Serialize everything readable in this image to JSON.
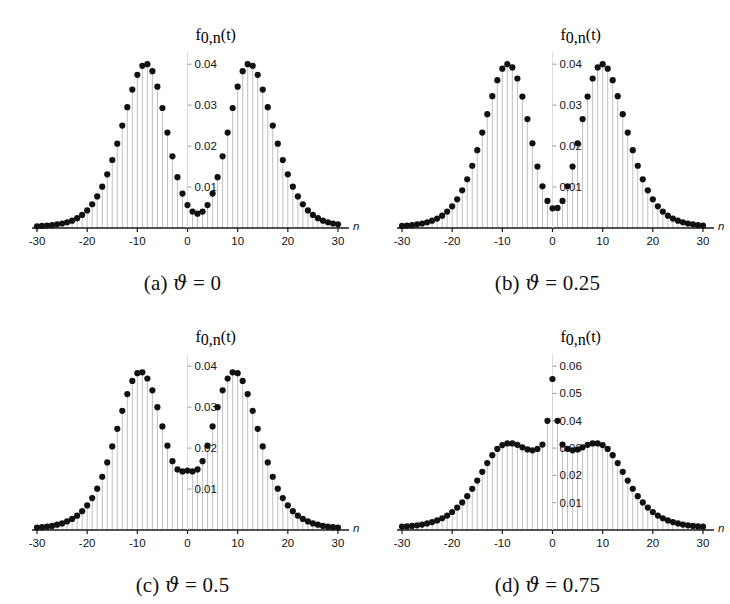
{
  "figure": {
    "background_color": "#ffffff",
    "marker_color": "#111111",
    "stem_color": "#b9b9b9",
    "axis_color": "#1a1a1a"
  },
  "panels": [
    {
      "key": "a",
      "caption_index": "(a)",
      "caption_symbol": "ϑ",
      "caption_equals": "=",
      "caption_value": "0",
      "caption_full": "(a) ϑ = 0"
    },
    {
      "key": "b",
      "caption_index": "(b)",
      "caption_symbol": "ϑ",
      "caption_equals": "=",
      "caption_value": "0.25",
      "caption_full": "(b) ϑ = 0.25"
    },
    {
      "key": "c",
      "caption_index": "(c)",
      "caption_symbol": "ϑ",
      "caption_equals": "=",
      "caption_value": "0.5",
      "caption_full": "(c) ϑ = 0.5"
    },
    {
      "key": "d",
      "caption_index": "(d)",
      "caption_symbol": "ϑ",
      "caption_equals": "=",
      "caption_value": "0.75",
      "caption_full": "(d) ϑ = 0.75"
    }
  ],
  "chart_data": [
    {
      "type": "scatter",
      "panel": "a",
      "title": "(a) ϑ = 0",
      "xlabel": "n",
      "ylabel": "f_{0,n}(t)",
      "ylabel_parts": {
        "base": "f",
        "sub": "0,",
        "sub_italic": "n",
        "tail": "(t)"
      },
      "xlim": [
        -31,
        31
      ],
      "ylim": [
        0,
        0.042
      ],
      "xticks": [
        -30,
        -20,
        -10,
        0,
        10,
        20,
        30
      ],
      "xticklabels": [
        "-30",
        "-20",
        "-10",
        "0",
        "10",
        "20",
        "30"
      ],
      "yticks": [
        0.01,
        0.02,
        0.03,
        0.04
      ],
      "yticklabels": [
        "0.01",
        "0.02",
        "0.03",
        "0.04"
      ],
      "grid": false,
      "stems": true,
      "x": [
        -30,
        -29,
        -28,
        -27,
        -26,
        -25,
        -24,
        -23,
        -22,
        -21,
        -20,
        -19,
        -18,
        -17,
        -16,
        -15,
        -14,
        -13,
        -12,
        -11,
        -10,
        -9,
        -8,
        -7,
        -6,
        -5,
        -4,
        -3,
        -2,
        -1,
        0,
        1,
        2,
        3,
        4,
        5,
        6,
        7,
        8,
        9,
        10,
        11,
        12,
        13,
        14,
        15,
        16,
        17,
        18,
        19,
        20,
        21,
        22,
        23,
        24,
        25,
        26,
        27,
        28,
        29,
        30
      ],
      "values": [
        0.0004,
        0.0005,
        0.0006,
        0.0007,
        0.0009,
        0.0011,
        0.0014,
        0.0018,
        0.0024,
        0.0032,
        0.0043,
        0.0058,
        0.0077,
        0.0101,
        0.0131,
        0.0166,
        0.0206,
        0.025,
        0.0295,
        0.0338,
        0.0374,
        0.0396,
        0.04,
        0.0383,
        0.0345,
        0.0293,
        0.0233,
        0.0175,
        0.0124,
        0.0084,
        0.0056,
        0.004,
        0.0035,
        0.004,
        0.0056,
        0.0084,
        0.0124,
        0.0175,
        0.0233,
        0.0293,
        0.0345,
        0.0383,
        0.04,
        0.0396,
        0.0374,
        0.0338,
        0.0295,
        0.025,
        0.0206,
        0.0166,
        0.0131,
        0.0101,
        0.0077,
        0.0058,
        0.0043,
        0.0032,
        0.0024,
        0.0018,
        0.0014,
        0.0011,
        0.0009
      ]
    },
    {
      "type": "scatter",
      "panel": "b",
      "title": "(b) ϑ = 0.25",
      "xlabel": "n",
      "ylabel": "f_{0,n}(t)",
      "ylabel_parts": {
        "base": "f",
        "sub": "0,",
        "sub_italic": "n",
        "tail": "(t)"
      },
      "xlim": [
        -31,
        31
      ],
      "ylim": [
        0,
        0.042
      ],
      "xticks": [
        -30,
        -20,
        -10,
        0,
        10,
        20,
        30
      ],
      "xticklabels": [
        "-30",
        "-20",
        "-10",
        "0",
        "10",
        "20",
        "30"
      ],
      "yticks": [
        0.01,
        0.02,
        0.03,
        0.04
      ],
      "yticklabels": [
        "0.01",
        "0.02",
        "0.03",
        "0.04"
      ],
      "grid": false,
      "stems": true,
      "x": [
        -30,
        -29,
        -28,
        -27,
        -26,
        -25,
        -24,
        -23,
        -22,
        -21,
        -20,
        -19,
        -18,
        -17,
        -16,
        -15,
        -14,
        -13,
        -12,
        -11,
        -10,
        -9,
        -8,
        -7,
        -6,
        -5,
        -4,
        -3,
        -2,
        -1,
        0,
        1,
        2,
        3,
        4,
        5,
        6,
        7,
        8,
        9,
        10,
        11,
        12,
        13,
        14,
        15,
        16,
        17,
        18,
        19,
        20,
        21,
        22,
        23,
        24,
        25,
        26,
        27,
        28,
        29,
        30
      ],
      "values": [
        0.0005,
        0.0006,
        0.0007,
        0.0009,
        0.0011,
        0.0014,
        0.0018,
        0.0023,
        0.003,
        0.004,
        0.0053,
        0.007,
        0.0092,
        0.0119,
        0.0152,
        0.019,
        0.0233,
        0.0278,
        0.0322,
        0.0361,
        0.0389,
        0.04,
        0.0392,
        0.0365,
        0.0321,
        0.0266,
        0.0207,
        0.015,
        0.0102,
        0.0066,
        0.0048,
        0.0049,
        0.0066,
        0.0102,
        0.015,
        0.0207,
        0.0266,
        0.0321,
        0.0365,
        0.0392,
        0.04,
        0.0389,
        0.0361,
        0.0322,
        0.0278,
        0.0233,
        0.019,
        0.0152,
        0.0119,
        0.0092,
        0.007,
        0.0053,
        0.004,
        0.003,
        0.0023,
        0.0018,
        0.0014,
        0.0011,
        0.0009,
        0.0007,
        0.0006
      ]
    },
    {
      "type": "scatter",
      "panel": "c",
      "title": "(c) ϑ = 0.5",
      "xlabel": "n",
      "ylabel": "f_{0,n}(t)",
      "ylabel_parts": {
        "base": "f",
        "sub": "0,",
        "sub_italic": "n",
        "tail": "(t)"
      },
      "xlim": [
        -31,
        31
      ],
      "ylim": [
        0,
        0.042
      ],
      "xticks": [
        -30,
        -20,
        -10,
        0,
        10,
        20,
        30
      ],
      "xticklabels": [
        "-30",
        "-20",
        "-10",
        "0",
        "10",
        "20",
        "30"
      ],
      "yticks": [
        0.01,
        0.02,
        0.03,
        0.04
      ],
      "yticklabels": [
        "0.01",
        "0.02",
        "0.03",
        "0.04"
      ],
      "grid": false,
      "stems": true,
      "x": [
        -30,
        -29,
        -28,
        -27,
        -26,
        -25,
        -24,
        -23,
        -22,
        -21,
        -20,
        -19,
        -18,
        -17,
        -16,
        -15,
        -14,
        -13,
        -12,
        -11,
        -10,
        -9,
        -8,
        -7,
        -6,
        -5,
        -4,
        -3,
        -2,
        -1,
        0,
        1,
        2,
        3,
        4,
        5,
        6,
        7,
        8,
        9,
        10,
        11,
        12,
        13,
        14,
        15,
        16,
        17,
        18,
        19,
        20,
        21,
        22,
        23,
        24,
        25,
        26,
        27,
        28,
        29,
        30
      ],
      "values": [
        0.0006,
        0.0007,
        0.0008,
        0.001,
        0.0013,
        0.0016,
        0.0021,
        0.0027,
        0.0035,
        0.0046,
        0.006,
        0.0078,
        0.0101,
        0.013,
        0.0165,
        0.0204,
        0.0247,
        0.0291,
        0.0332,
        0.0364,
        0.0383,
        0.0385,
        0.037,
        0.0341,
        0.03,
        0.0253,
        0.0206,
        0.0168,
        0.0148,
        0.0143,
        0.0145,
        0.0143,
        0.0148,
        0.0168,
        0.0206,
        0.0253,
        0.03,
        0.0341,
        0.037,
        0.0385,
        0.0383,
        0.0364,
        0.0332,
        0.0291,
        0.0247,
        0.0204,
        0.0165,
        0.013,
        0.0101,
        0.0078,
        0.006,
        0.0046,
        0.0035,
        0.0027,
        0.0021,
        0.0016,
        0.0013,
        0.001,
        0.0008,
        0.0007,
        0.0006
      ]
    },
    {
      "type": "scatter",
      "panel": "d",
      "title": "(d) ϑ = 0.75",
      "xlabel": "n",
      "ylabel": "f_{0,n}(t)",
      "ylabel_parts": {
        "base": "f",
        "sub": "0,",
        "sub_italic": "n",
        "tail": "(t)"
      },
      "xlim": [
        -31,
        31
      ],
      "ylim": [
        0,
        0.063
      ],
      "xticks": [
        -30,
        -20,
        -10,
        0,
        10,
        20,
        30
      ],
      "xticklabels": [
        "-30",
        "-20",
        "-10",
        "0",
        "10",
        "20",
        "30"
      ],
      "yticks": [
        0.01,
        0.02,
        0.03,
        0.04,
        0.05,
        0.06
      ],
      "yticklabels": [
        "0.01",
        "0.02",
        "0.03",
        "0.04",
        "0.05",
        "0.06"
      ],
      "grid": false,
      "stems": true,
      "x": [
        -30,
        -29,
        -28,
        -27,
        -26,
        -25,
        -24,
        -23,
        -22,
        -21,
        -20,
        -19,
        -18,
        -17,
        -16,
        -15,
        -14,
        -13,
        -12,
        -11,
        -10,
        -9,
        -8,
        -7,
        -6,
        -5,
        -4,
        -3,
        -2,
        -1,
        0,
        1,
        2,
        3,
        4,
        5,
        6,
        7,
        8,
        9,
        10,
        11,
        12,
        13,
        14,
        15,
        16,
        17,
        18,
        19,
        20,
        21,
        22,
        23,
        24,
        25,
        26,
        27,
        28,
        29,
        30
      ],
      "values": [
        0.0012,
        0.0013,
        0.0015,
        0.0017,
        0.002,
        0.0024,
        0.0029,
        0.0035,
        0.0043,
        0.0053,
        0.0066,
        0.0082,
        0.0101,
        0.0124,
        0.0151,
        0.0181,
        0.0213,
        0.0245,
        0.0274,
        0.0297,
        0.0311,
        0.0317,
        0.0317,
        0.0312,
        0.0303,
        0.0295,
        0.0292,
        0.0297,
        0.0313,
        0.04,
        0.0553,
        0.04,
        0.0313,
        0.0297,
        0.0292,
        0.0295,
        0.0303,
        0.0312,
        0.0317,
        0.0317,
        0.0311,
        0.0297,
        0.0274,
        0.0245,
        0.0213,
        0.0181,
        0.0151,
        0.0124,
        0.0101,
        0.0082,
        0.0066,
        0.0053,
        0.0043,
        0.0035,
        0.0029,
        0.0024,
        0.002,
        0.0017,
        0.0015,
        0.0013,
        0.0012
      ]
    }
  ]
}
